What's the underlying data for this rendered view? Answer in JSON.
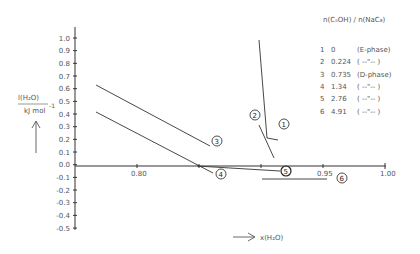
{
  "chart_data": {
    "type": "line",
    "title": "",
    "xlabel": "x(H2O)",
    "ylabel": "l(H2O) / kJ mol^-1",
    "xlim": [
      0.75,
      1.0
    ],
    "ylim": [
      -0.5,
      1.0
    ],
    "grid": false,
    "x_ticks": [
      "0.80",
      "0.95",
      "1.00"
    ],
    "y_ticks": [
      "1.0",
      "0.9",
      "0.8",
      "0.7",
      "0.6",
      "0.5",
      "0.4",
      "0.3",
      "0.2",
      "0.1",
      "0.0",
      "-0.1",
      "-0.2",
      "-0.3",
      "-0.4",
      "-0.5"
    ],
    "legend_title": "n(C5OH)/n(NaC8)",
    "legend_position": "upper right",
    "series": [
      {
        "name": "1",
        "ratio": "0",
        "phase": "(E-phase)",
        "x": [
          0.898,
          0.905,
          0.914
        ],
        "y": [
          1.0,
          0.22,
          0.21
        ]
      },
      {
        "name": "2",
        "ratio": "0.224",
        "phase": "( --\"-- )",
        "x": [
          0.898,
          0.91
        ],
        "y": [
          0.33,
          0.06
        ]
      },
      {
        "name": "3",
        "ratio": "0.735",
        "phase": "(D-phase)",
        "x": [
          0.767,
          0.859
        ],
        "y": [
          0.64,
          0.16
        ]
      },
      {
        "name": "4",
        "ratio": "1.34",
        "phase": "( --\"-- )",
        "x": [
          0.767,
          0.861
        ],
        "y": [
          0.43,
          -0.06
        ]
      },
      {
        "name": "5",
        "ratio": "2.76",
        "phase": "( --\"-- )",
        "x": [
          0.848,
          0.915
        ],
        "y": [
          0.0,
          -0.04
        ]
      },
      {
        "name": "6",
        "ratio": "4.91",
        "phase": "( --\"-- )",
        "x": [
          0.9,
          0.953
        ],
        "y": [
          -0.1,
          -0.1
        ]
      }
    ]
  },
  "axes": {
    "ylabel_top": "l(H₂O)",
    "ylabel_bottom": "kJ mol",
    "ylabel_exp": "-1",
    "xlabel": "x(H₂O)"
  },
  "legend": {
    "title": "n(C₅OH) / n(NaC₈)",
    "rows": [
      {
        "num": "1",
        "ratio": "0",
        "phase": "(E-phase)"
      },
      {
        "num": "2",
        "ratio": "0.224",
        "phase": "(  --\"--  )"
      },
      {
        "num": "3",
        "ratio": "0.735",
        "phase": "(D-phase)"
      },
      {
        "num": "4",
        "ratio": "1.34",
        "phase": "(  --\"--  )"
      },
      {
        "num": "5",
        "ratio": "2.76",
        "phase": "(  --\"--  )"
      },
      {
        "num": "6",
        "ratio": "4.91",
        "phase": "(  --\"--  )"
      }
    ]
  },
  "markers": [
    "1",
    "2",
    "3",
    "4",
    "5",
    "6"
  ],
  "colors": {
    "line": "#333333",
    "text": "#555555",
    "background": "#ffffff"
  }
}
